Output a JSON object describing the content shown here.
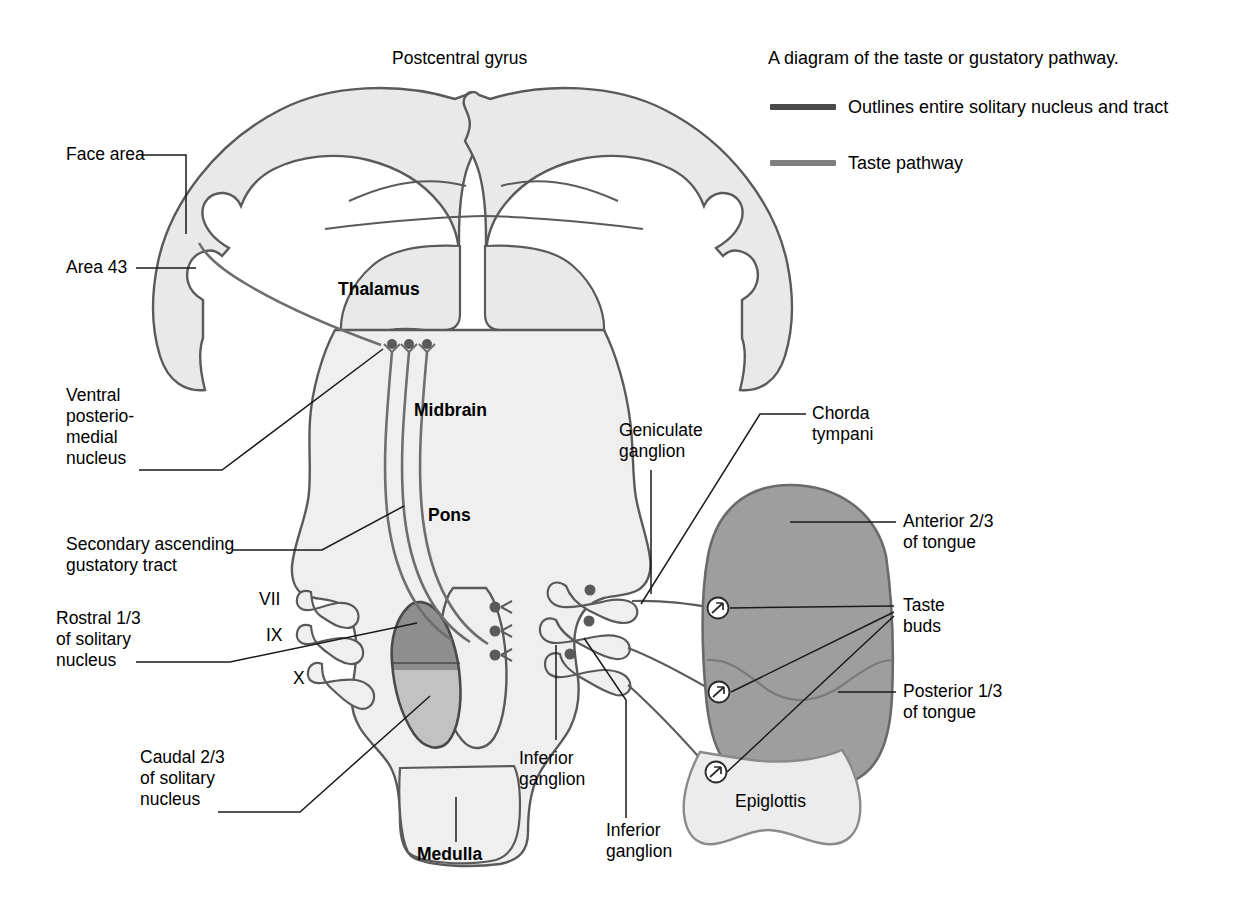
{
  "figure": {
    "title_top": "Postcentral gyrus",
    "caption": "A diagram of the taste or gustatory pathway."
  },
  "legend": {
    "items": [
      {
        "label": "Outlines entire solitary nucleus and tract",
        "color": "#4a4a4a"
      },
      {
        "label": "Taste pathway",
        "color": "#7f7f7f"
      }
    ]
  },
  "labels": {
    "face_area": "Face area",
    "area_43": "Area 43",
    "vpm": "Ventral\nposterio-\nmedial\nnucleus",
    "secondary_tract": "Secondary ascending\ngustatory tract",
    "rostral": "Rostral 1/3\nof solitary\nnucleus",
    "caudal": "Caudal 2/3\nof solitary\nnucleus",
    "thalamus": "Thalamus",
    "midbrain": "Midbrain",
    "pons": "Pons",
    "medulla": "Medulla",
    "nerve_vii": "VII",
    "nerve_ix": "IX",
    "nerve_x": "X",
    "geniculate": "Geniculate\nganglion",
    "chorda": "Chorda\ntympani",
    "anterior_tongue": "Anterior 2/3\nof tongue",
    "taste_buds": "Taste\nbuds",
    "posterior_tongue": "Posterior 1/3\nof tongue",
    "inferior_ganglion_1": "Inferior\nganglion",
    "inferior_ganglion_2": "Inferior\nganglion",
    "epiglottis": "Epiglottis"
  },
  "colors": {
    "outline": "#5a5a5a",
    "brain_fill": "#e9e9e9",
    "brainstem_fill": "#efefef",
    "tongue_fill": "#9e9e9e",
    "epiglottis_fill": "#ececec",
    "nucleus_rostral": "#8e8e8e",
    "nucleus_caudal": "#c2c2c2",
    "pathway": "#6e6e6e",
    "leader": "#1a1a1a"
  }
}
